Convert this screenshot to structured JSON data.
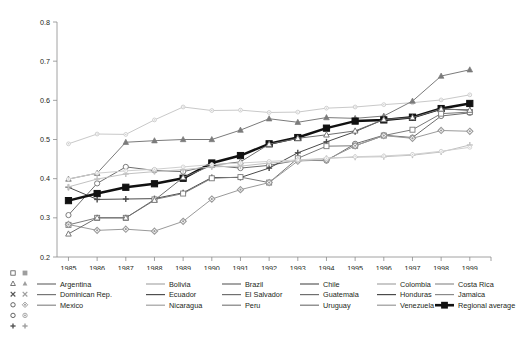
{
  "chart_data": {
    "type": "line",
    "title": "",
    "xlabel": "",
    "ylabel": "",
    "x": [
      1985,
      1986,
      1987,
      1988,
      1989,
      1990,
      1991,
      1992,
      1993,
      1994,
      1995,
      1996,
      1997,
      1998,
      1999
    ],
    "xlim": [
      1984.6,
      1999.6
    ],
    "ylim": [
      0.2,
      0.8
    ],
    "ytick_labels": [
      "0.2",
      "0.3",
      "0.4",
      "0.5",
      "0.6",
      "0.7",
      "0.8"
    ],
    "yticks": [
      0.2,
      0.3,
      0.4,
      0.5,
      0.6,
      0.7,
      0.8
    ],
    "xtick_labels": [
      "1985",
      "1986",
      "1987",
      "1988",
      "1989",
      "1990",
      "1991",
      "1992",
      "1993",
      "1994",
      "1995",
      "1996",
      "1997",
      "1998",
      "1999"
    ],
    "grid": false,
    "legend_position": "below-plot",
    "series": [
      {
        "name": "Argentina",
        "marker": "triangle",
        "color": "#6f6f6f",
        "values": [
          0.399,
          0.414,
          0.493,
          0.497,
          0.5,
          0.5,
          0.524,
          0.553,
          0.544,
          0.556,
          0.554,
          0.56,
          0.598,
          0.662,
          0.678
        ]
      },
      {
        "name": "Bolivia",
        "marker": "line",
        "color": "#9b9b9b",
        "values": [
          null,
          null,
          null,
          null,
          null,
          null,
          null,
          null,
          null,
          null,
          null,
          null,
          null,
          null,
          null
        ]
      },
      {
        "name": "Brazil",
        "marker": "line",
        "color": "#7a7a7a",
        "values": [
          null,
          null,
          null,
          null,
          null,
          null,
          null,
          null,
          null,
          null,
          null,
          null,
          null,
          null,
          null
        ]
      },
      {
        "name": "Chile",
        "marker": "line",
        "color": "#6a6a6a",
        "values": [
          null,
          null,
          null,
          null,
          null,
          null,
          null,
          null,
          null,
          null,
          null,
          null,
          null,
          null,
          null
        ]
      },
      {
        "name": "Colombia",
        "marker": "line",
        "color": "#9b9b9b",
        "values": [
          null,
          null,
          null,
          null,
          null,
          null,
          null,
          null,
          null,
          null,
          null,
          null,
          null,
          null,
          null
        ]
      },
      {
        "name": "Costa Rica",
        "marker": "line",
        "color": "#8a8a8a",
        "values": [
          null,
          null,
          null,
          null,
          null,
          null,
          null,
          null,
          null,
          null,
          null,
          null,
          null,
          null,
          null
        ]
      },
      {
        "name": "Dominican Rep.",
        "marker": "x",
        "color": "#b0b0b0",
        "values": [
          null,
          null,
          null,
          null,
          null,
          null,
          null,
          null,
          null,
          null,
          null,
          null,
          null,
          null,
          null
        ]
      },
      {
        "name": "Ecuador",
        "marker": "line",
        "color": "#5f5f5f",
        "values": [
          null,
          null,
          null,
          null,
          null,
          null,
          null,
          null,
          null,
          null,
          null,
          null,
          null,
          null,
          null
        ]
      },
      {
        "name": "El Salvador",
        "marker": "line",
        "color": "#6f6f6f",
        "values": [
          null,
          null,
          null,
          null,
          null,
          null,
          null,
          null,
          null,
          null,
          null,
          null,
          null,
          null,
          null
        ]
      },
      {
        "name": "Guatemala",
        "marker": "line",
        "color": "#8a8a8a",
        "values": [
          null,
          null,
          null,
          null,
          null,
          null,
          null,
          null,
          null,
          null,
          null,
          null,
          null,
          null,
          null
        ]
      },
      {
        "name": "Honduras",
        "marker": "line",
        "color": "#5a5a5a",
        "values": [
          null,
          null,
          null,
          null,
          null,
          null,
          null,
          null,
          null,
          null,
          null,
          null,
          null,
          null,
          null
        ]
      },
      {
        "name": "Jamaica",
        "marker": "line",
        "color": "#9b9b9b",
        "values": [
          null,
          null,
          null,
          null,
          null,
          null,
          null,
          null,
          null,
          null,
          null,
          null,
          null,
          null,
          null
        ]
      },
      {
        "name": "Mexico",
        "marker": "diamond",
        "color": "#8a8a8a",
        "values": [
          null,
          null,
          null,
          null,
          null,
          null,
          null,
          null,
          null,
          null,
          null,
          null,
          null,
          null,
          null
        ]
      },
      {
        "name": "Nicaragua",
        "marker": "line",
        "color": "#9b9b9b",
        "values": [
          null,
          null,
          null,
          null,
          null,
          null,
          null,
          null,
          null,
          null,
          null,
          null,
          null,
          null,
          null
        ]
      },
      {
        "name": "Peru",
        "marker": "line",
        "color": "#7a7a7a",
        "values": [
          null,
          null,
          null,
          null,
          null,
          null,
          null,
          null,
          null,
          null,
          null,
          null,
          null,
          null,
          null
        ]
      },
      {
        "name": "Uruguay",
        "marker": "line",
        "color": "#6a6a6a",
        "values": [
          null,
          null,
          null,
          null,
          null,
          null,
          null,
          null,
          null,
          null,
          null,
          null,
          null,
          null,
          null
        ]
      },
      {
        "name": "Venezuela",
        "marker": "line",
        "color": "#9b9b9b",
        "values": [
          null,
          null,
          null,
          null,
          null,
          null,
          null,
          null,
          null,
          null,
          null,
          null,
          null,
          null,
          null
        ]
      },
      {
        "name": "Regional average",
        "marker": "filled-square",
        "color": "#111111",
        "values": [
          0.344,
          0.362,
          0.378,
          0.387,
          0.401,
          0.44,
          0.459,
          0.489,
          0.505,
          0.529,
          0.547,
          0.55,
          0.557,
          0.579,
          0.592
        ]
      }
    ],
    "plot_series": [
      {
        "id": "s-topgray",
        "marker": "dot",
        "color": "#c9c9c9",
        "width": 1.0,
        "values": [
          0.489,
          0.514,
          0.513,
          0.55,
          0.583,
          0.574,
          0.575,
          0.569,
          0.57,
          0.58,
          0.583,
          0.589,
          0.594,
          0.601,
          0.614
        ]
      },
      {
        "id": "s-argentina",
        "marker": "triangle",
        "color": "#7b7b7b",
        "width": 1.0,
        "values": [
          0.399,
          0.414,
          0.493,
          0.497,
          0.5,
          0.5,
          0.524,
          0.553,
          0.544,
          0.556,
          0.554,
          0.56,
          0.598,
          0.662,
          0.678
        ]
      },
      {
        "id": "s-opencircle",
        "marker": "circle-open",
        "color": "#6e6e6e",
        "width": 1.0,
        "values": [
          0.307,
          0.388,
          0.43,
          0.421,
          0.418,
          0.434,
          0.427,
          0.434,
          0.447,
          0.446,
          0.489,
          0.511,
          0.505,
          0.56,
          0.568
        ]
      },
      {
        "id": "s-plus",
        "marker": "plus",
        "color": "#4a4a4a",
        "width": 1.0,
        "values": [
          0.378,
          0.347,
          0.348,
          0.349,
          0.364,
          0.403,
          0.403,
          0.427,
          0.466,
          0.494,
          0.52,
          0.551,
          0.556,
          0.578,
          0.575
        ]
      },
      {
        "id": "s-avg",
        "marker": "square-filled",
        "color": "#111111",
        "width": 2.5,
        "values": [
          0.344,
          0.362,
          0.378,
          0.387,
          0.401,
          0.44,
          0.459,
          0.489,
          0.505,
          0.529,
          0.547,
          0.55,
          0.557,
          0.579,
          0.592
        ]
      },
      {
        "id": "s-opensq",
        "marker": "square-open",
        "color": "#7a7a7a",
        "width": 1.0,
        "values": [
          0.282,
          0.3,
          0.3,
          0.347,
          0.362,
          0.401,
          0.404,
          0.39,
          0.452,
          0.483,
          0.484,
          0.51,
          0.525,
          0.566,
          0.57
        ]
      },
      {
        "id": "s-diamond",
        "marker": "diamond",
        "color": "#9a9a9a",
        "width": 1.0,
        "values": [
          0.283,
          0.268,
          0.271,
          0.266,
          0.291,
          0.348,
          0.372,
          0.39,
          0.445,
          0.448,
          0.484,
          0.51,
          0.503,
          0.523,
          0.521
        ]
      },
      {
        "id": "s-tri-open",
        "marker": "triangle-open",
        "color": "#6e6e6e",
        "width": 1.0,
        "values": [
          0.259,
          0.3,
          0.3,
          0.345,
          0.403,
          0.434,
          0.443,
          0.488,
          0.503,
          0.512,
          0.522,
          0.551,
          0.556,
          0.578,
          0.575
        ]
      },
      {
        "id": "s-lightplus",
        "marker": "plus-light",
        "color": "#c2c2c2",
        "width": 1.0,
        "values": [
          0.379,
          0.399,
          0.412,
          0.418,
          0.423,
          0.43,
          0.432,
          0.44,
          0.445,
          0.452,
          0.455,
          0.456,
          0.46,
          0.468,
          0.486
        ]
      },
      {
        "id": "s-lightgray2",
        "marker": "dot-light",
        "color": "#cfcfcf",
        "width": 1.0,
        "values": [
          0.399,
          0.414,
          0.42,
          0.424,
          0.43,
          0.436,
          0.44,
          0.444,
          0.448,
          0.452,
          0.456,
          0.458,
          0.462,
          0.47,
          0.48
        ]
      }
    ]
  },
  "legend": {
    "columns": [
      {
        "items": [
          {
            "label": "Argentina",
            "marker": "triangle",
            "color": "#6f6f6f"
          },
          {
            "label": "Dominican Rep.",
            "marker": "line",
            "color": "#767676"
          },
          {
            "label": "Mexico",
            "marker": "line",
            "color": "#8a8a8a"
          }
        ]
      },
      {
        "items": [
          {
            "label": "Bolivia",
            "marker": "line",
            "color": "#a8a8a8"
          },
          {
            "label": "Ecuador",
            "marker": "line",
            "color": "#4f4f4f"
          },
          {
            "label": "Nicaragua",
            "marker": "line",
            "color": "#a0a0a0"
          }
        ]
      },
      {
        "items": [
          {
            "label": "Brazil",
            "marker": "line",
            "color": "#6a6a6a"
          },
          {
            "label": "El Salvador",
            "marker": "line",
            "color": "#707070"
          },
          {
            "label": "Peru",
            "marker": "line",
            "color": "#7e7e7e"
          }
        ]
      },
      {
        "items": [
          {
            "label": "Chile",
            "marker": "line",
            "color": "#5a5a5a"
          },
          {
            "label": "Guatemala",
            "marker": "line",
            "color": "#6f6f6f"
          },
          {
            "label": "Uruguay",
            "marker": "line",
            "color": "#777777"
          }
        ]
      },
      {
        "items": [
          {
            "label": "Colombia",
            "marker": "line",
            "color": "#a5a5a5"
          },
          {
            "label": "Honduras",
            "marker": "line",
            "color": "#4a4a4a"
          },
          {
            "label": "Venezuela",
            "marker": "line",
            "color": "#999999"
          }
        ]
      },
      {
        "items": [
          {
            "label": "Costa Rica",
            "marker": "line",
            "color": "#909090"
          },
          {
            "label": "Jamaica",
            "marker": "line",
            "color": "#8a8a8a"
          },
          {
            "label": "Regional average",
            "marker": "square-filled",
            "color": "#111111"
          }
        ]
      }
    ],
    "decoration_markers": [
      [
        "square-open",
        "square-filled"
      ],
      [
        "triangle-open",
        "triangle-filled"
      ],
      [
        "x-dark",
        "x-light"
      ],
      [
        "circle-open",
        "diamond"
      ],
      [
        "circle-open",
        "circle-dot"
      ],
      [
        "plus-dark",
        "plus-light"
      ]
    ]
  }
}
